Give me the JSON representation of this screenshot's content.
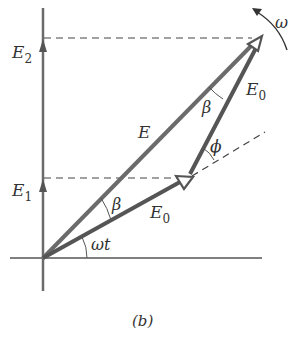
{
  "figure": {
    "caption": "(b)",
    "colors": {
      "axis": "#6b6b6b",
      "phasor": "#555555",
      "dashed": "#444444",
      "text": "#333333",
      "background": "#ffffff"
    },
    "labels": {
      "E2": "E",
      "E2_sub": "2",
      "E1": "E",
      "E1_sub": "1",
      "E": "E",
      "E0_top": "E",
      "E0_top_sub": "0",
      "E0_bottom": "E",
      "E0_bottom_sub": "0",
      "beta_top": "β",
      "beta_bottom": "β",
      "phi": "ϕ",
      "omega_t": "ωt",
      "omega": "ω"
    },
    "geometry": {
      "origin": [
        43,
        258
      ],
      "resultant_tip": [
        260,
        38
      ],
      "first_phasor_tip": [
        188,
        178
      ],
      "E2_level_y": 38,
      "E1_level_y": 178
    }
  }
}
